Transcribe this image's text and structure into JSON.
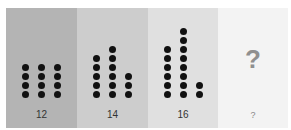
{
  "panels": [
    {
      "label": "12",
      "columns": [
        4,
        4,
        4
      ]
    },
    {
      "label": "14",
      "columns": [
        5,
        6,
        3
      ]
    },
    {
      "label": "16",
      "columns": [
        6,
        8,
        2
      ]
    },
    {
      "label": "?",
      "question_mark": "?"
    }
  ],
  "colors": {
    "panel1": "#b4b4b4",
    "panel2": "#cdcdcd",
    "panel3": "#e0e0e0",
    "panel4": "#f3f3f3",
    "dot": "#111111"
  }
}
